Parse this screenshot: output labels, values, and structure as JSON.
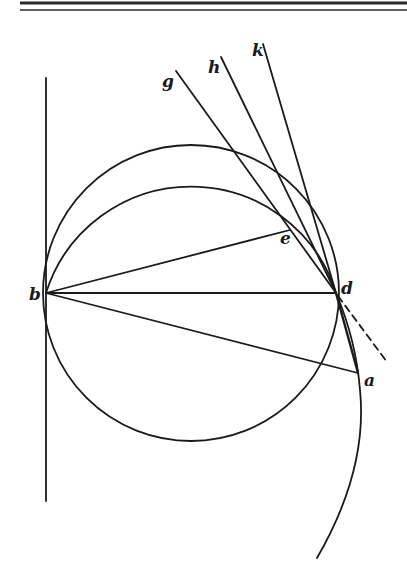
{
  "figure": {
    "type": "geometric-construction",
    "labels": {
      "a": "a",
      "b": "b",
      "d": "d",
      "e": "e",
      "g": "g",
      "h": "h",
      "k": "k"
    },
    "points": {
      "a": [
        358,
        373
      ],
      "b": [
        46,
        293
      ],
      "d": [
        336,
        293
      ],
      "e": [
        290,
        230
      ],
      "g": [
        176,
        71
      ],
      "h": [
        221,
        57
      ],
      "k": [
        263,
        44
      ]
    },
    "elements": [
      "header double rule",
      "vertical tangent line through b",
      "circle with diameter bd",
      "arc through b, e, d",
      "lines b-e, b-d, b-a",
      "lines g-d, h-d, k-d",
      "curve from d through a",
      "chord d-a",
      "dashed tangent extension at d"
    ]
  }
}
